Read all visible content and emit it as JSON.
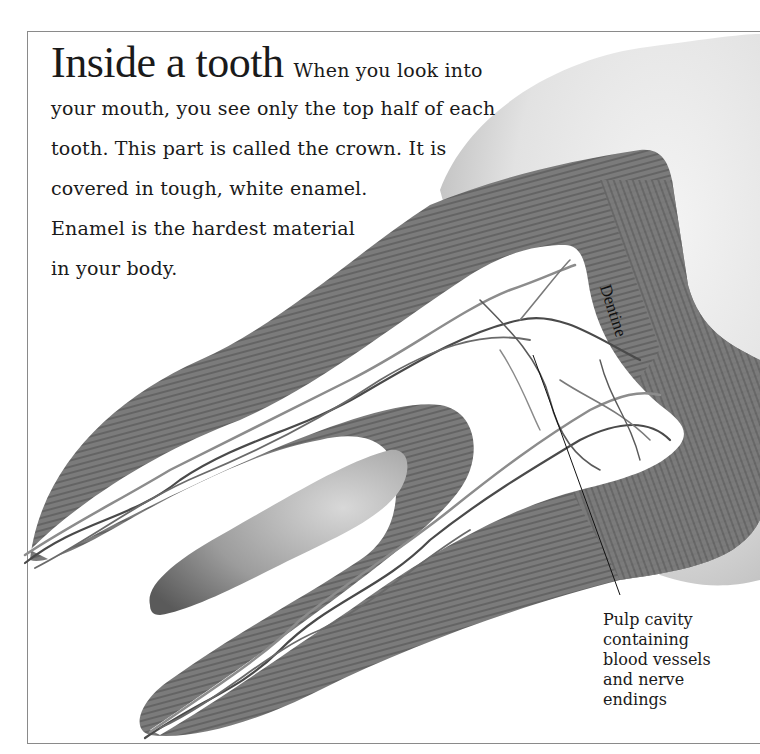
{
  "intro": {
    "title": "Inside a tooth",
    "lines": [
      "When you look into",
      "your mouth, you see only the top half of each",
      "tooth. This part is called the crown. It is",
      "covered in tough, white enamel.",
      "Enamel is the hardest material",
      "in your body."
    ]
  },
  "labels": {
    "dentine": "Dentine",
    "pulp": [
      "Pulp cavity",
      "containing",
      "blood vessels",
      "and nerve",
      "endings"
    ]
  },
  "colors": {
    "dentine": "#7a7a7a",
    "dentine_stripe": "#5e5e5e",
    "enamel_light": "#f2f2f2",
    "enamel_dark": "#bdbdbd",
    "bone": "#9a9a9a",
    "vessel_dark": "#4a4a4a",
    "vessel_light": "#8c8c8c",
    "frame": "#8a8a8a"
  }
}
